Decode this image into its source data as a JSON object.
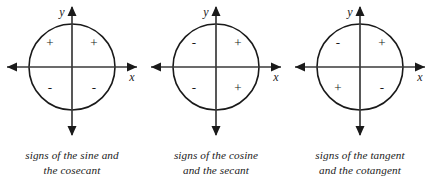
{
  "figure": {
    "background_color": "#ffffff",
    "stroke_color": "#1a1a1a",
    "text_color": "#1a1a1a",
    "diagrams": [
      {
        "id": "sine-cosecant",
        "axis_label_x": "x",
        "axis_label_y": "y",
        "quadrant_signs": {
          "q1": "+",
          "q2": "+",
          "q3": "-",
          "q4": "-"
        },
        "caption_line1": "signs of the sine and",
        "caption_line2": "the cosecant"
      },
      {
        "id": "cosine-secant",
        "axis_label_x": "x",
        "axis_label_y": "y",
        "quadrant_signs": {
          "q1": "+",
          "q2": "-",
          "q3": "-",
          "q4": "+"
        },
        "caption_line1": "signs of the cosine",
        "caption_line2": "and the secant"
      },
      {
        "id": "tangent-cotangent",
        "axis_label_x": "x",
        "axis_label_y": "y",
        "quadrant_signs": {
          "q1": "+",
          "q2": "-",
          "q3": "+",
          "q4": "-"
        },
        "caption_line1": "signs of the tangent",
        "caption_line2": "and the cotangent"
      }
    ]
  }
}
